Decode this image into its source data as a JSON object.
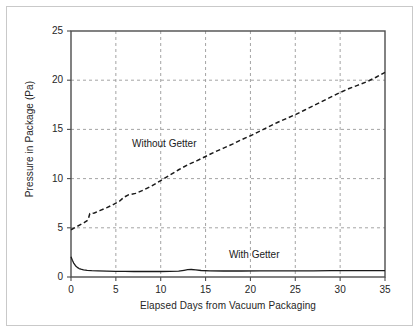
{
  "chart_data": {
    "type": "line",
    "title": "",
    "subtitle": "",
    "xlabel": "Elapsed Days from Vacuum Packaging",
    "ylabel": "Pressure in Package (Pa)",
    "xlim": [
      0,
      35
    ],
    "ylim": [
      0,
      25
    ],
    "xticks": [
      0,
      5,
      10,
      15,
      20,
      25,
      30,
      35
    ],
    "yticks": [
      0,
      5,
      10,
      15,
      20,
      25
    ],
    "xtick_labels": [
      "0",
      "5",
      "10",
      "15",
      "20",
      "25",
      "30",
      "35"
    ],
    "ytick_labels": [
      "0",
      "5",
      "10",
      "15",
      "20",
      "25"
    ],
    "grid": true,
    "grid_style": "dashed",
    "grid_color": "#9a9a9a",
    "legend_position": "inline-annotation",
    "axes_color": "#4d4d4d",
    "background_color": "#ffffff",
    "series": [
      {
        "name": "Without Getter",
        "style": "dashed",
        "color": "#1a1a1a",
        "x": [
          0,
          0.5,
          1,
          1.5,
          1.9,
          2.1,
          2.6,
          3.2,
          4,
          4.8,
          5.4,
          5.9,
          6.4,
          7.2,
          8,
          9,
          10,
          11,
          12,
          13,
          14,
          15,
          16,
          17,
          18,
          19,
          20,
          21,
          22,
          23,
          24,
          25,
          26,
          27,
          28,
          29,
          30,
          31,
          32,
          33,
          34,
          35
        ],
        "y": [
          4.8,
          5.05,
          5.3,
          5.55,
          5.8,
          6.45,
          6.5,
          6.75,
          7.05,
          7.4,
          7.7,
          8.1,
          8.35,
          8.5,
          8.8,
          9.25,
          9.8,
          10.35,
          10.9,
          11.4,
          11.8,
          12.25,
          12.7,
          13.1,
          13.5,
          13.95,
          14.35,
          14.8,
          15.25,
          15.7,
          16.1,
          16.5,
          16.95,
          17.4,
          17.85,
          18.3,
          18.75,
          19.15,
          19.5,
          19.85,
          20.3,
          20.8
        ]
      },
      {
        "name": "With Getter",
        "style": "solid",
        "color": "#1a1a1a",
        "x": [
          0,
          0.15,
          0.3,
          0.5,
          0.7,
          0.9,
          1.1,
          1.4,
          1.8,
          2.3,
          3,
          4,
          5,
          6,
          7,
          8,
          9,
          10,
          11,
          12,
          12.6,
          13,
          13.4,
          13.9,
          14.5,
          15.5,
          17,
          19,
          21,
          23,
          25,
          27,
          29,
          31,
          33,
          35
        ],
        "y": [
          2.05,
          1.7,
          1.42,
          1.15,
          0.98,
          0.86,
          0.79,
          0.72,
          0.67,
          0.64,
          0.62,
          0.6,
          0.58,
          0.57,
          0.56,
          0.56,
          0.56,
          0.56,
          0.57,
          0.6,
          0.68,
          0.74,
          0.76,
          0.72,
          0.66,
          0.62,
          0.61,
          0.61,
          0.62,
          0.62,
          0.63,
          0.63,
          0.64,
          0.64,
          0.65,
          0.65
        ]
      }
    ],
    "annotations": [
      {
        "text": "Without Getter",
        "x": 6.8,
        "y": 13.4
      },
      {
        "text": "With Getter",
        "x": 17.6,
        "y": 2.1
      }
    ]
  },
  "axis": {
    "x_title": "Elapsed Days from Vacuum Packaging",
    "y_title": "Pressure in Package (Pa)"
  },
  "annotations": {
    "without_getter": "Without Getter",
    "with_getter": "With Getter"
  },
  "ticks": {
    "x": [
      "0",
      "5",
      "10",
      "15",
      "20",
      "25",
      "30",
      "35"
    ],
    "y": [
      "0",
      "5",
      "10",
      "15",
      "20",
      "25"
    ]
  }
}
